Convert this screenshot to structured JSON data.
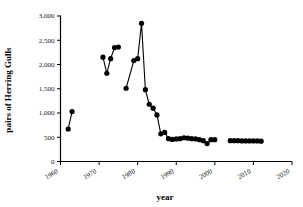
{
  "chart_data": {
    "type": "line",
    "title": "",
    "subtitle": "",
    "xlabel": "year",
    "ylabel": "pairs of Herring Gulls",
    "xlim": [
      1960,
      2020
    ],
    "ylim": [
      0,
      3000
    ],
    "xticks": [
      1960,
      1970,
      1980,
      1990,
      2000,
      2010,
      2020
    ],
    "xtick_labels": [
      "1960",
      "1970",
      "1980",
      "1990",
      "2000",
      "2010",
      "2020"
    ],
    "yticks": [
      0,
      500,
      1000,
      1500,
      2000,
      2500,
      3000
    ],
    "ytick_labels": [
      "0",
      "500",
      "1,000",
      "1,500",
      "2,000",
      "2,500",
      "3,000"
    ],
    "grid": false,
    "legend": false,
    "marker": "filled-circle",
    "marker_color": "#000000",
    "line_color": "#000000",
    "series": [
      {
        "name": "pairs of Herring Gulls",
        "segments": [
          {
            "x": [
              1962,
              1963
            ],
            "y": [
              670,
              1030
            ]
          },
          {
            "x": [
              1971,
              1972,
              1973,
              1974,
              1975
            ],
            "y": [
              2150,
              1820,
              2120,
              2350,
              2360
            ]
          },
          {
            "x": [
              1977,
              1979,
              1980,
              1981,
              1982,
              1983,
              1984,
              1985,
              1986,
              1987,
              1988,
              1989,
              1990,
              1991,
              1992,
              1993,
              1994,
              1995,
              1996,
              1997,
              1998,
              1999,
              2000
            ],
            "y": [
              1510,
              2080,
              2120,
              2850,
              1480,
              1180,
              1100,
              960,
              570,
              600,
              470,
              455,
              465,
              470,
              490,
              480,
              470,
              465,
              450,
              430,
              370,
              450,
              450
            ]
          },
          {
            "x": [
              2004,
              2005,
              2006,
              2007,
              2008,
              2009,
              2010,
              2011,
              2012
            ],
            "y": [
              430,
              430,
              430,
              425,
              425,
              425,
              425,
              425,
              420
            ]
          }
        ]
      }
    ]
  }
}
